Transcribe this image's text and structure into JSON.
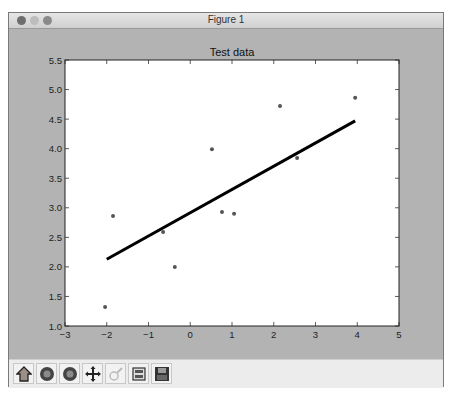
{
  "window": {
    "title": "Figure 1"
  },
  "toolbar": {
    "buttons": [
      {
        "name": "home",
        "icon": "home-icon"
      },
      {
        "name": "back",
        "icon": "back-arrow-icon"
      },
      {
        "name": "forward",
        "icon": "forward-arrow-icon"
      },
      {
        "name": "pan",
        "icon": "pan-icon"
      },
      {
        "name": "zoom",
        "icon": "zoom-icon",
        "disabled": true
      },
      {
        "name": "configure-subplots",
        "icon": "subplots-icon"
      },
      {
        "name": "save",
        "icon": "save-icon"
      }
    ]
  },
  "chart_data": {
    "type": "scatter",
    "title": "Test data",
    "xlabel": "",
    "ylabel": "",
    "xlim": [
      -3,
      5
    ],
    "ylim": [
      1.0,
      5.5
    ],
    "xticks": [
      "−3",
      "−2",
      "−1",
      "0",
      "1",
      "2",
      "3",
      "4",
      "5"
    ],
    "xtick_values": [
      -3,
      -2,
      -1,
      0,
      1,
      2,
      3,
      4,
      5
    ],
    "yticks": [
      "1.0",
      "1.5",
      "2.0",
      "2.5",
      "3.0",
      "3.5",
      "4.0",
      "4.5",
      "5.0",
      "5.5"
    ],
    "ytick_values": [
      1.0,
      1.5,
      2.0,
      2.5,
      3.0,
      3.5,
      4.0,
      4.5,
      5.0,
      5.5
    ],
    "grid": false,
    "series": [
      {
        "name": "data",
        "kind": "scatter",
        "color": "#555555",
        "points": [
          {
            "x": -2.04,
            "y": 1.32
          },
          {
            "x": -1.85,
            "y": 2.86
          },
          {
            "x": -0.65,
            "y": 2.59
          },
          {
            "x": -0.37,
            "y": 2.0
          },
          {
            "x": 0.52,
            "y": 3.99
          },
          {
            "x": 0.76,
            "y": 2.93
          },
          {
            "x": 1.05,
            "y": 2.9
          },
          {
            "x": 2.15,
            "y": 4.72
          },
          {
            "x": 2.56,
            "y": 3.84
          },
          {
            "x": 3.95,
            "y": 4.86
          }
        ]
      },
      {
        "name": "fit",
        "kind": "line",
        "color": "#000000",
        "points": [
          {
            "x": -2.0,
            "y": 2.13
          },
          {
            "x": 3.95,
            "y": 4.47
          }
        ]
      }
    ]
  }
}
